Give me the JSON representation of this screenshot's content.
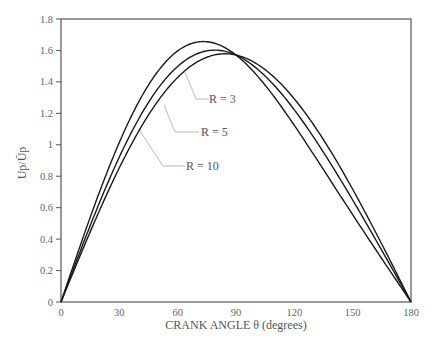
{
  "chart_data": {
    "type": "line",
    "title": "",
    "xlabel": "CRANK ANGLE θ (degrees)",
    "ylabel": "Up/Ūp",
    "xlim": [
      0,
      180
    ],
    "ylim": [
      0,
      1.8
    ],
    "xticks": [
      0,
      30,
      60,
      90,
      120,
      150,
      180
    ],
    "xtick_labels": [
      "0",
      "30",
      "60",
      "90",
      "120",
      "150",
      "180"
    ],
    "yticks": [
      0,
      0.2,
      0.4,
      0.6,
      0.8,
      1,
      1.2,
      1.4,
      1.6,
      1.8
    ],
    "ytick_labels": [
      "0",
      "0.2",
      "0.4",
      "0.6",
      "0.8",
      "1",
      "1.2",
      "1.4",
      "1.6",
      "1.8"
    ],
    "grid": false,
    "legend": "inline labels with leader lines",
    "x": [
      0,
      15,
      30,
      45,
      60,
      75,
      90,
      105,
      120,
      135,
      150,
      165,
      180
    ],
    "series": [
      {
        "name": "R = 3",
        "R": 3,
        "values": [
          0,
          0.54,
          1.05,
          1.4,
          1.62,
          1.65,
          1.57,
          1.39,
          1.15,
          0.85,
          0.53,
          0.21,
          0
        ]
      },
      {
        "name": "R = 5",
        "R": 5,
        "values": [
          0,
          0.49,
          0.95,
          1.32,
          1.56,
          1.63,
          1.57,
          1.41,
          1.22,
          0.93,
          0.62,
          0.32,
          0
        ]
      },
      {
        "name": "R = 10",
        "R": 10,
        "values": [
          0,
          0.45,
          0.86,
          1.21,
          1.47,
          1.6,
          1.57,
          1.44,
          1.29,
          1.01,
          0.71,
          0.37,
          0
        ]
      }
    ],
    "annotations": [
      {
        "text": "R = 3",
        "series": "R = 3"
      },
      {
        "text": "R = 5",
        "series": "R = 5"
      },
      {
        "text": "R = 10",
        "series": "R = 10"
      }
    ]
  },
  "labels": {
    "x_axis_title": "CRANK ANGLE θ (degrees)",
    "y_axis_title": "Up/Ūp",
    "r3": "R = 3",
    "r5": "R = 5",
    "r10": "R = 10"
  },
  "colors": {
    "curve": "#1a1a1a",
    "axis": "#555555",
    "leader": "#bbbbbb",
    "text": "#555555"
  }
}
